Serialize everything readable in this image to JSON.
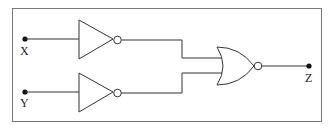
{
  "diagram": {
    "type": "logic-circuit",
    "inputs": [
      {
        "label": "X",
        "gate": "NOT"
      },
      {
        "label": "Y",
        "gate": "NOT"
      }
    ],
    "combining_gate": "NOR",
    "output": {
      "label": "Z"
    },
    "colors": {
      "stroke": "#333333",
      "background": "#ffffff",
      "frame": "#777777"
    }
  }
}
